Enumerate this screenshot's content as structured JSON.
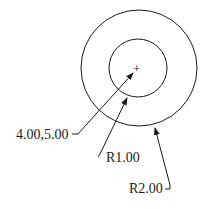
{
  "drawing": {
    "center_label": "4.00,5.00",
    "inner_radius_label": "R1.00",
    "outer_radius_label": "R2.00",
    "center_mark": "+",
    "stroke_color": "#1a1a1a"
  }
}
